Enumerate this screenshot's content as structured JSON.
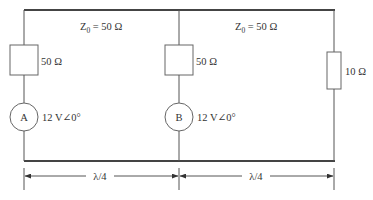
{
  "diagram": {
    "type": "transmission-line circuit",
    "segments": [
      {
        "id": "line-1",
        "impedance_label": "Z",
        "impedance_sub": "0",
        "impedance_value": " = 50 Ω",
        "length_label": "λ/4"
      },
      {
        "id": "line-2",
        "impedance_label": "Z",
        "impedance_sub": "0",
        "impedance_value": " = 50 Ω",
        "length_label": "λ/4"
      }
    ],
    "sources": [
      {
        "id": "A",
        "label": "A",
        "value": "12 V∠0°",
        "series_impedance": "50 Ω"
      },
      {
        "id": "B",
        "label": "B",
        "value": "12 V∠0°",
        "series_impedance": "50 Ω"
      }
    ],
    "load": {
      "value": "10 Ω"
    }
  },
  "colors": {
    "wire": "#555555",
    "text": "#333333",
    "background": "#ffffff"
  }
}
